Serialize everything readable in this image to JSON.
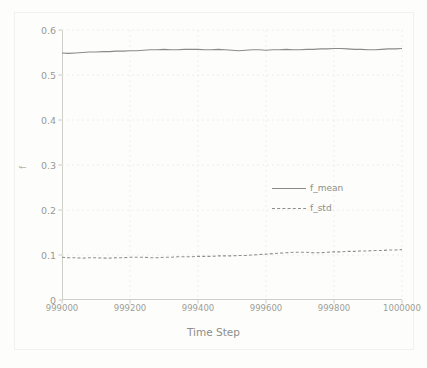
{
  "chart_data": {
    "type": "line",
    "title": "",
    "xlabel": "Time Step",
    "ylabel": "f",
    "xlim": [
      999000,
      1000000
    ],
    "ylim": [
      0,
      0.6
    ],
    "grid": true,
    "legend_position": "center-right",
    "xticks": [
      999000,
      999200,
      999400,
      999600,
      999800,
      1000000
    ],
    "xtick_labels": [
      "999000",
      "999200",
      "999400",
      "999600",
      "999800",
      "1000000"
    ],
    "yticks": [
      0,
      0.1,
      0.2,
      0.3,
      0.4,
      0.5,
      0.6
    ],
    "ytick_labels": [
      "0",
      "0.1",
      "0.2",
      "0.3",
      "0.4",
      "0.5",
      "0.6"
    ],
    "x": [
      999000,
      999020,
      999040,
      999060,
      999080,
      999100,
      999120,
      999140,
      999160,
      999180,
      999200,
      999220,
      999240,
      999260,
      999280,
      999300,
      999320,
      999340,
      999360,
      999380,
      999400,
      999420,
      999440,
      999460,
      999480,
      999500,
      999520,
      999540,
      999560,
      999580,
      999600,
      999620,
      999640,
      999660,
      999680,
      999700,
      999720,
      999740,
      999760,
      999780,
      999800,
      999820,
      999840,
      999860,
      999880,
      999900,
      999920,
      999940,
      999960,
      999980,
      1000000
    ],
    "series": [
      {
        "name": "f_mean",
        "style": "solid",
        "color": "#8a8a86",
        "values": [
          0.549,
          0.548,
          0.549,
          0.55,
          0.551,
          0.551,
          0.552,
          0.552,
          0.553,
          0.553,
          0.554,
          0.554,
          0.555,
          0.556,
          0.556,
          0.557,
          0.556,
          0.556,
          0.557,
          0.557,
          0.557,
          0.556,
          0.556,
          0.557,
          0.556,
          0.555,
          0.554,
          0.555,
          0.556,
          0.556,
          0.555,
          0.556,
          0.556,
          0.557,
          0.556,
          0.556,
          0.557,
          0.557,
          0.558,
          0.558,
          0.559,
          0.559,
          0.558,
          0.557,
          0.557,
          0.556,
          0.556,
          0.557,
          0.558,
          0.558,
          0.559
        ]
      },
      {
        "name": "f_std",
        "style": "dashed",
        "color": "#8f8f8a",
        "values": [
          0.095,
          0.094,
          0.094,
          0.093,
          0.094,
          0.094,
          0.093,
          0.093,
          0.094,
          0.094,
          0.095,
          0.095,
          0.095,
          0.094,
          0.094,
          0.095,
          0.095,
          0.096,
          0.096,
          0.096,
          0.097,
          0.097,
          0.097,
          0.098,
          0.098,
          0.098,
          0.099,
          0.099,
          0.1,
          0.101,
          0.102,
          0.103,
          0.104,
          0.105,
          0.106,
          0.106,
          0.106,
          0.105,
          0.105,
          0.106,
          0.107,
          0.107,
          0.108,
          0.108,
          0.109,
          0.109,
          0.11,
          0.11,
          0.111,
          0.111,
          0.112
        ]
      }
    ]
  },
  "legend": {
    "entries": [
      {
        "label": "f_mean",
        "style": "solid"
      },
      {
        "label": "f_std",
        "style": "dashed"
      }
    ]
  },
  "colors": {
    "line_mean": "#8a8a86",
    "line_std": "#8f8f8a",
    "axis": "#cfcfc9",
    "grid": "#eeeeea",
    "tick_text": "#9a9a94",
    "background": "#fdfdfc"
  }
}
